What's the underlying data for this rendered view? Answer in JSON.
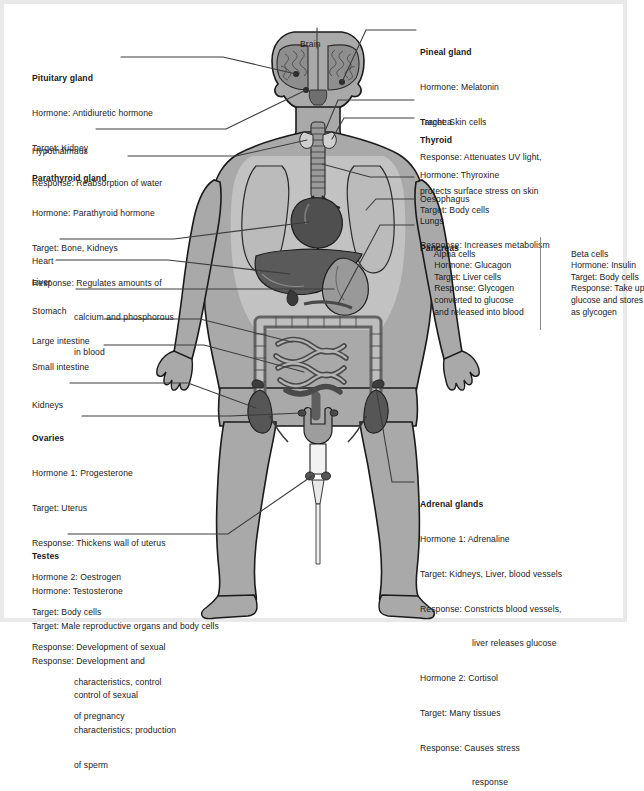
{
  "diagram": {
    "colors": {
      "body_fill": "#a9a9a9",
      "body_outline": "#1a1a1a",
      "organ_dark": "#4a4a4a",
      "organ_mid": "#777777",
      "organ_light": "#bdbdbd",
      "cavity_fill": "#c4c4c4",
      "leader_line": "#3c3c3c",
      "page_border": "#e9e9e9",
      "background": "#ffffff"
    },
    "labels": {
      "brain": {
        "title": "Brain"
      },
      "pituitary": {
        "title": "Pituitary gland",
        "lines": [
          "Hormone: Antidiuretic hormone",
          "Target: Kidney",
          "Response: Reabsorption of water"
        ]
      },
      "hypothalamus": {
        "title": "Hypothalmaus"
      },
      "parathyroid": {
        "title": "Parathyroid gland",
        "lines": [
          "Hormone: Parathyroid hormone",
          "Target: Bone, Kidneys",
          "Response: Regulates amounts of"
        ],
        "cont": [
          "calcium and phosphorous",
          "in blood"
        ]
      },
      "heart": {
        "title": "Heart"
      },
      "liver": {
        "title": "Liver"
      },
      "stomach": {
        "title": "Stomach"
      },
      "large_intestine": {
        "title": "Large intestine"
      },
      "small_intestine": {
        "title": "Small intestine"
      },
      "kidneys": {
        "title": "Kidneys"
      },
      "ovaries": {
        "title": "Ovaries",
        "lines": [
          "Hormone 1: Progesterone",
          "Target: Uterus",
          "Response: Thickens wall of uterus",
          "Hormone 2: Oestrogen",
          "Target: Body cells",
          "Response: Development of sexual"
        ],
        "cont": [
          "characteristics, control",
          "of pregnancy"
        ]
      },
      "testes": {
        "title": "Testes",
        "lines": [
          "Hormone: Testosterone",
          "Target: Male reproductive organs and body cells",
          "Response: Development and"
        ],
        "cont": [
          "control of sexual",
          "characteristics; production",
          "of sperm"
        ]
      },
      "pineal": {
        "title": "Pineal gland",
        "lines": [
          "Hormone: Melatonin",
          "Target: Skin cells",
          "Response: Attenuates UV light,",
          "protects surface stress on skin"
        ]
      },
      "trachea": {
        "title": "Trachea"
      },
      "thyroid": {
        "title": "Thyroid",
        "lines": [
          "Hormone: Thyroxine",
          "Target: Body cells",
          "Response: Increases metabolism"
        ]
      },
      "oesophagus": {
        "title": "Oesophagus"
      },
      "lungs": {
        "title": "Lungs"
      },
      "pancreas": {
        "title": "Pancreas",
        "alpha": [
          "Alpha cells",
          "Hormone: Glucagon",
          "Target: Liver cells",
          "Response: Glycogen",
          "converted to glucose",
          "and released into blood"
        ],
        "beta": [
          "Beta cells",
          "Hormone: Insulin",
          "Target: Body cells",
          "Response: Take up",
          "glucose and stores",
          "as glycogen"
        ]
      },
      "adrenal": {
        "title": "Adrenal glands",
        "lines": [
          "Hormone 1: Adrenaline",
          "Target: Kidneys, Liver, blood vessels",
          "Response: Constricts blood vessels,"
        ],
        "cont1": [
          "liver releases glucose"
        ],
        "lines2": [
          "Hormone 2: Cortisol",
          "Target: Many tissues",
          "Response: Causes stress"
        ],
        "cont2": [
          "response"
        ]
      }
    }
  }
}
